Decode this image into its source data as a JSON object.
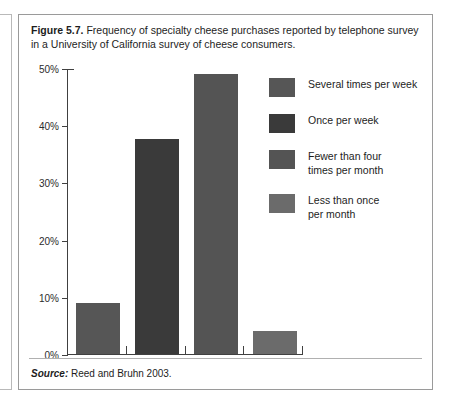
{
  "figure": {
    "caption_label": "Figure 5.7.",
    "caption_text": " Frequency of specialty cheese purchases reported by telephone survey in a University of California survey of cheese consumers.",
    "source_label": "Source:",
    "source_text": " Reed and Bruhn 2003."
  },
  "chart_data": {
    "type": "bar",
    "title": "Frequency of specialty cheese purchases reported by telephone survey in a University of California survey of cheese consumers.",
    "xlabel": "",
    "ylabel": "",
    "ylim": [
      0,
      50
    ],
    "grid": false,
    "legend_position": "right",
    "ytick_labels": [
      "0%",
      "10%",
      "20%",
      "30%",
      "40%",
      "50%"
    ],
    "ytick_values": [
      0,
      10,
      20,
      30,
      40,
      50
    ],
    "categories": [
      "Several times per week",
      "Once per week",
      "Fewer than four times per month",
      "Less than once per month"
    ],
    "values": [
      9,
      37.5,
      49,
      4
    ],
    "colors": [
      "#565656",
      "#3a3a3a",
      "#545454",
      "#6b6b6b"
    ],
    "legend": [
      {
        "label": "Several times per week",
        "color": "#565656"
      },
      {
        "label": "Once per week",
        "color": "#3a3a3a"
      },
      {
        "label": "Fewer than four\ntimes per month",
        "color": "#545454"
      },
      {
        "label": "Less than once\nper month",
        "color": "#6b6b6b"
      }
    ]
  }
}
